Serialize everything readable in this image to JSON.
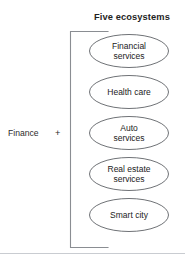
{
  "diagram": {
    "title": "Five ecosystems",
    "left_group": {
      "label": "Finance",
      "operator": "+"
    },
    "bracket": {
      "name": "right-facing-bracket",
      "color": "#8a8d92"
    },
    "nodes": [
      {
        "label": "Financial\nservices",
        "shape": "ellipse",
        "lines": 2
      },
      {
        "label": "Health care",
        "shape": "ellipse",
        "lines": 1
      },
      {
        "label": "Auto\nservices",
        "shape": "ellipse",
        "lines": 2
      },
      {
        "label": "Real estate\nservices",
        "shape": "ellipse",
        "lines": 2
      },
      {
        "label": "Smart city",
        "shape": "ellipse",
        "lines": 1
      }
    ],
    "colors": {
      "text": "#222222",
      "title_text": "#1f1f1f",
      "stroke": "#6f7276",
      "bracket": "#8a8d92",
      "rule": "#c9ccd1",
      "background": "#ffffff"
    }
  }
}
